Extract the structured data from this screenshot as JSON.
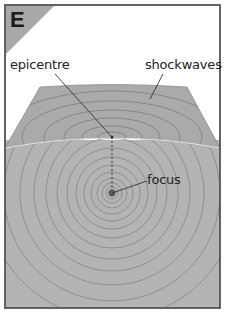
{
  "panel": {
    "letter": "E",
    "colors": {
      "frame": "#555555",
      "badge": "#a8a8a8",
      "ground": "#b4b4b4",
      "surface_top": "#a9a9a9",
      "wave_line": "#8a8a8a",
      "surface_edge": "#e6e6e6",
      "focus_dot": "#5a5a5a"
    }
  },
  "labels": {
    "epicentre": "epicentre",
    "shockwaves": "shockwaves",
    "focus": "focus"
  },
  "geometry": {
    "focus": [
      112,
      193
    ],
    "epicentre": [
      112,
      137
    ]
  }
}
